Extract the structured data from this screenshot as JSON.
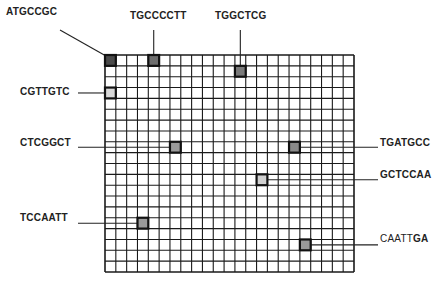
{
  "grid": {
    "left": 105,
    "top": 55,
    "right": 354,
    "bottom": 272,
    "cols": 23,
    "rows": 20,
    "line_color": "#1a1a1a"
  },
  "probes": [
    {
      "label": "ATGCCGC",
      "col": 0,
      "row": 0,
      "fill": "#4a4a4a",
      "label_x": 6,
      "label_y": 12,
      "leader": "diag"
    },
    {
      "label": "TGCCCCTT",
      "col": 4,
      "row": 0,
      "fill": "#6e6e6e",
      "label_x": 130,
      "label_y": 16,
      "leader": "up"
    },
    {
      "label": "TGGCTCG",
      "col": 12,
      "row": 1,
      "fill": "#7a7a7a",
      "label_x": 215,
      "label_y": 16,
      "leader": "up"
    },
    {
      "label": "CGTTGTC",
      "col": 0,
      "row": 3,
      "fill": "#d8d8d8",
      "label_x": 20,
      "label_y": 92,
      "leader": "left"
    },
    {
      "label": "CTCGGCT",
      "col": 6,
      "row": 8,
      "fill": "#9a9a9a",
      "label_x": 20,
      "label_y": 143,
      "leader": "left"
    },
    {
      "label": "TGATGCC",
      "col": 17,
      "row": 8,
      "fill": "#8a8a8a",
      "label_x": 380,
      "label_y": 143,
      "leader": "right"
    },
    {
      "label": "GCTCCAA",
      "col": 14,
      "row": 11,
      "fill": "#d0d0d0",
      "label_x": 380,
      "label_y": 175,
      "leader": "right"
    },
    {
      "label": "TCCAATT",
      "col": 3,
      "row": 15,
      "fill": "#9a9a9a",
      "label_x": 20,
      "label_y": 218,
      "leader": "left"
    },
    {
      "label_plain": "CAATT",
      "label_bold": "GA",
      "col": 18,
      "row": 17,
      "fill": "#9a9a9a",
      "label_x": 380,
      "label_y": 239,
      "leader": "right"
    }
  ]
}
